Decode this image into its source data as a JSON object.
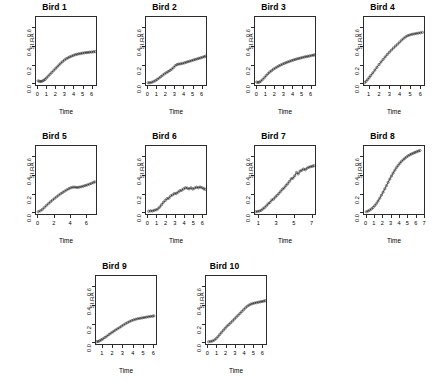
{
  "figure": {
    "layout": "4x4x2 grid of small-multiple panels",
    "background_color": "#ffffff",
    "axis_color": "#2b2b2b",
    "point_color": "#333333",
    "line_color": "#222222"
  },
  "chart_data": [
    {
      "type": "scatter",
      "title": "Bird 1",
      "xlabel": "Time",
      "ylabel": "SI.RA",
      "xlim": [
        -0.25,
        6.6
      ],
      "ylim": [
        -0.03,
        0.72
      ],
      "xticks": [
        0,
        1,
        2,
        3,
        4,
        5,
        6
      ],
      "yticks": [
        0.0,
        0.2,
        0.4,
        0.6
      ],
      "ytick_labels": [
        "0.0",
        "0.2",
        "0.4",
        "0.6"
      ],
      "grid": false,
      "legend": "none",
      "marker": "open-circle",
      "has_fit_line": true,
      "x": [
        0.1,
        0.25,
        0.4,
        0.55,
        0.7,
        0.85,
        1.0,
        1.2,
        1.4,
        1.6,
        1.8,
        2.0,
        2.2,
        2.4,
        2.6,
        2.8,
        3.0,
        3.2,
        3.4,
        3.6,
        3.8,
        4.0,
        4.2,
        4.4,
        4.6,
        4.8,
        5.0,
        5.2,
        5.4,
        5.6,
        5.8,
        6.0,
        6.2,
        6.4
      ],
      "y": [
        0.025,
        0.02,
        0.018,
        0.022,
        0.03,
        0.04,
        0.055,
        0.075,
        0.095,
        0.115,
        0.135,
        0.155,
        0.175,
        0.195,
        0.215,
        0.232,
        0.248,
        0.262,
        0.272,
        0.282,
        0.29,
        0.298,
        0.305,
        0.31,
        0.315,
        0.318,
        0.322,
        0.325,
        0.328,
        0.33,
        0.332,
        0.334,
        0.336,
        0.338
      ]
    },
    {
      "type": "scatter",
      "title": "Bird 2",
      "xlabel": "Time",
      "ylabel": "SI.RA",
      "xlim": [
        -0.25,
        6.6
      ],
      "ylim": [
        -0.03,
        0.72
      ],
      "xticks": [
        0,
        1,
        2,
        3,
        4,
        5,
        6
      ],
      "yticks": [
        0.0,
        0.2,
        0.4,
        0.6
      ],
      "ytick_labels": [
        "0.0",
        "0.2",
        "0.4",
        "0.6"
      ],
      "grid": false,
      "legend": "none",
      "marker": "open-circle",
      "has_fit_line": true,
      "x": [
        0.1,
        0.3,
        0.5,
        0.7,
        0.9,
        1.1,
        1.3,
        1.5,
        1.7,
        1.9,
        2.1,
        2.3,
        2.5,
        2.7,
        2.9,
        3.1,
        3.3,
        3.5,
        3.7,
        3.9,
        4.1,
        4.3,
        4.5,
        4.7,
        4.9,
        5.1,
        5.3,
        5.5,
        5.7,
        5.9,
        6.1,
        6.3,
        6.45
      ],
      "y": [
        0.005,
        0.005,
        0.01,
        0.018,
        0.028,
        0.04,
        0.055,
        0.07,
        0.085,
        0.1,
        0.112,
        0.124,
        0.136,
        0.15,
        0.168,
        0.188,
        0.2,
        0.205,
        0.208,
        0.212,
        0.218,
        0.224,
        0.23,
        0.236,
        0.242,
        0.248,
        0.254,
        0.26,
        0.266,
        0.272,
        0.278,
        0.284,
        0.29
      ]
    },
    {
      "type": "scatter",
      "title": "Bird 3",
      "xlabel": "Time",
      "ylabel": "SI.RA",
      "xlim": [
        -0.25,
        6.6
      ],
      "ylim": [
        -0.03,
        0.72
      ],
      "xticks": [
        0,
        1,
        2,
        3,
        4,
        5,
        6
      ],
      "yticks": [
        0.0,
        0.2,
        0.4,
        0.6
      ],
      "ytick_labels": [
        "0.0",
        "0.2",
        "0.4",
        "0.6"
      ],
      "grid": false,
      "legend": "none",
      "marker": "open-circle",
      "has_fit_line": true,
      "x": [
        0.05,
        0.2,
        0.35,
        0.5,
        0.7,
        0.9,
        1.1,
        1.3,
        1.5,
        1.7,
        1.9,
        2.1,
        2.3,
        2.5,
        2.7,
        2.9,
        3.1,
        3.3,
        3.5,
        3.7,
        3.9,
        4.1,
        4.3,
        4.5,
        4.7,
        4.9,
        5.1,
        5.3,
        5.5,
        5.7,
        5.9,
        6.1,
        6.3,
        6.45
      ],
      "y": [
        0.012,
        0.008,
        0.012,
        0.022,
        0.04,
        0.06,
        0.082,
        0.102,
        0.12,
        0.135,
        0.15,
        0.162,
        0.174,
        0.185,
        0.195,
        0.204,
        0.212,
        0.22,
        0.228,
        0.235,
        0.242,
        0.248,
        0.254,
        0.26,
        0.265,
        0.27,
        0.275,
        0.28,
        0.284,
        0.288,
        0.292,
        0.296,
        0.3,
        0.304
      ]
    },
    {
      "type": "scatter",
      "title": "Bird 4",
      "xlabel": "Time",
      "ylabel": "SI.RA",
      "xlim": [
        0.45,
        6.45
      ],
      "ylim": [
        -0.03,
        0.72
      ],
      "xticks": [
        1,
        2,
        3,
        4,
        5,
        6
      ],
      "yticks": [
        0.0,
        0.2,
        0.4,
        0.6
      ],
      "ytick_labels": [
        "0.0",
        "0.2",
        "0.4",
        "0.6"
      ],
      "grid": false,
      "legend": "none",
      "marker": "open-circle",
      "has_fit_line": true,
      "x": [
        0.6,
        0.75,
        0.9,
        1.05,
        1.2,
        1.4,
        1.6,
        1.8,
        2.0,
        2.2,
        2.4,
        2.6,
        2.8,
        3.0,
        3.2,
        3.4,
        3.6,
        3.8,
        4.0,
        4.2,
        4.4,
        4.6,
        4.8,
        5.0,
        5.2,
        5.4,
        5.6,
        5.8,
        6.0,
        6.2
      ],
      "y": [
        0.005,
        0.02,
        0.04,
        0.06,
        0.082,
        0.11,
        0.14,
        0.17,
        0.2,
        0.228,
        0.255,
        0.282,
        0.308,
        0.332,
        0.355,
        0.378,
        0.398,
        0.418,
        0.44,
        0.462,
        0.482,
        0.498,
        0.51,
        0.518,
        0.524,
        0.528,
        0.532,
        0.536,
        0.54,
        0.545
      ]
    },
    {
      "type": "scatter",
      "title": "Bird 5",
      "xlabel": "Time",
      "ylabel": "SI.RA",
      "xlim": [
        -0.3,
        7.3
      ],
      "ylim": [
        -0.03,
        0.72
      ],
      "xticks": [
        0,
        2,
        4,
        6
      ],
      "yticks": [
        0.0,
        0.2,
        0.4,
        0.6
      ],
      "ytick_labels": [
        "0.0",
        "0.2",
        "0.4",
        "0.6"
      ],
      "grid": false,
      "legend": "none",
      "marker": "open-circle",
      "has_fit_line": true,
      "x": [
        0.1,
        0.35,
        0.6,
        0.85,
        1.1,
        1.35,
        1.6,
        1.85,
        2.1,
        2.35,
        2.6,
        2.85,
        3.1,
        3.35,
        3.6,
        3.85,
        4.1,
        4.35,
        4.6,
        4.85,
        5.1,
        5.35,
        5.6,
        5.85,
        6.1,
        6.35,
        6.6,
        6.85,
        7.05
      ],
      "y": [
        0.005,
        0.015,
        0.03,
        0.05,
        0.072,
        0.092,
        0.112,
        0.13,
        0.148,
        0.165,
        0.182,
        0.198,
        0.212,
        0.226,
        0.24,
        0.252,
        0.262,
        0.268,
        0.268,
        0.265,
        0.268,
        0.272,
        0.278,
        0.285,
        0.292,
        0.3,
        0.308,
        0.318,
        0.325
      ]
    },
    {
      "type": "scatter",
      "title": "Bird 6",
      "xlabel": "Time",
      "ylabel": "SI.RA",
      "xlim": [
        -0.25,
        6.5
      ],
      "ylim": [
        -0.03,
        0.72
      ],
      "xticks": [
        0,
        1,
        2,
        3,
        4,
        5,
        6
      ],
      "yticks": [
        0.0,
        0.2,
        0.4,
        0.6
      ],
      "ytick_labels": [
        "0.0",
        "0.2",
        "0.4",
        "0.6"
      ],
      "grid": false,
      "legend": "none",
      "marker": "open-circle",
      "has_fit_line": true,
      "x": [
        0.15,
        0.35,
        0.55,
        0.75,
        0.95,
        1.15,
        1.35,
        1.55,
        1.75,
        1.95,
        2.15,
        2.35,
        2.55,
        2.75,
        2.95,
        3.15,
        3.35,
        3.55,
        3.75,
        3.95,
        4.15,
        4.35,
        4.55,
        4.75,
        4.95,
        5.15,
        5.35,
        5.55,
        5.75,
        5.95,
        6.15,
        6.3
      ],
      "y": [
        0.01,
        0.015,
        0.012,
        0.02,
        0.025,
        0.035,
        0.055,
        0.08,
        0.105,
        0.125,
        0.145,
        0.15,
        0.175,
        0.185,
        0.2,
        0.2,
        0.215,
        0.23,
        0.235,
        0.25,
        0.262,
        0.258,
        0.25,
        0.262,
        0.248,
        0.258,
        0.268,
        0.262,
        0.27,
        0.262,
        0.252,
        0.245
      ]
    },
    {
      "type": "scatter",
      "title": "Bird 7",
      "xlabel": "Time",
      "ylabel": "SI.RA",
      "xlim": [
        0.5,
        7.5
      ],
      "ylim": [
        -0.03,
        0.72
      ],
      "xticks": [
        1,
        3,
        5,
        7
      ],
      "yticks": [
        0.0,
        0.2,
        0.4,
        0.6
      ],
      "ytick_labels": [
        "0.0",
        "0.2",
        "0.4",
        "0.6"
      ],
      "grid": false,
      "legend": "none",
      "marker": "open-circle",
      "has_fit_line": true,
      "x": [
        0.7,
        0.9,
        1.1,
        1.3,
        1.5,
        1.7,
        1.9,
        2.1,
        2.3,
        2.5,
        2.7,
        2.9,
        3.1,
        3.3,
        3.5,
        3.7,
        3.9,
        4.1,
        4.3,
        4.5,
        4.7,
        4.9,
        5.1,
        5.3,
        5.5,
        5.7,
        5.9,
        6.1,
        6.3,
        6.5,
        6.7,
        6.9,
        7.1,
        7.25
      ],
      "y": [
        0.005,
        0.008,
        0.012,
        0.02,
        0.035,
        0.05,
        0.068,
        0.09,
        0.105,
        0.13,
        0.14,
        0.162,
        0.18,
        0.2,
        0.222,
        0.245,
        0.26,
        0.285,
        0.305,
        0.33,
        0.358,
        0.365,
        0.39,
        0.425,
        0.41,
        0.44,
        0.45,
        0.462,
        0.455,
        0.472,
        0.482,
        0.488,
        0.492,
        0.498
      ]
    },
    {
      "type": "scatter",
      "title": "Bird 8",
      "xlabel": "Time",
      "ylabel": "SI.RA",
      "xlim": [
        -0.3,
        7.1
      ],
      "ylim": [
        -0.03,
        0.72
      ],
      "xticks": [
        0,
        1,
        2,
        3,
        4,
        5,
        6,
        7
      ],
      "yticks": [
        0.0,
        0.2,
        0.4,
        0.6
      ],
      "ytick_labels": [
        "0.0",
        "0.2",
        "0.4",
        "0.6"
      ],
      "grid": false,
      "legend": "none",
      "marker": "open-circle",
      "has_fit_line": true,
      "x": [
        0.1,
        0.3,
        0.5,
        0.7,
        0.9,
        1.1,
        1.3,
        1.5,
        1.7,
        1.9,
        2.1,
        2.3,
        2.5,
        2.7,
        2.9,
        3.1,
        3.3,
        3.5,
        3.7,
        3.9,
        4.1,
        4.3,
        4.5,
        4.7,
        4.9,
        5.1,
        5.3,
        5.5,
        5.7,
        5.9,
        6.1,
        6.3,
        6.5
      ],
      "y": [
        0.005,
        0.012,
        0.022,
        0.035,
        0.05,
        0.07,
        0.092,
        0.12,
        0.15,
        0.182,
        0.215,
        0.25,
        0.285,
        0.32,
        0.355,
        0.388,
        0.42,
        0.45,
        0.478,
        0.502,
        0.525,
        0.545,
        0.562,
        0.578,
        0.592,
        0.605,
        0.615,
        0.625,
        0.632,
        0.64,
        0.648,
        0.655,
        0.66
      ]
    },
    {
      "type": "scatter",
      "title": "Bird 9",
      "xlabel": "Time",
      "ylabel": "SI.RA",
      "xlim": [
        0.35,
        6.35
      ],
      "ylim": [
        -0.03,
        0.72
      ],
      "xticks": [
        1,
        2,
        3,
        4,
        5,
        6
      ],
      "yticks": [
        0.0,
        0.2,
        0.4,
        0.6
      ],
      "ytick_labels": [
        "0.0",
        "0.2",
        "0.4",
        "0.6"
      ],
      "grid": false,
      "legend": "none",
      "marker": "open-circle",
      "has_fit_line": true,
      "x": [
        0.5,
        0.65,
        0.8,
        0.95,
        1.1,
        1.3,
        1.5,
        1.7,
        1.9,
        2.1,
        2.3,
        2.5,
        2.7,
        2.9,
        3.1,
        3.3,
        3.5,
        3.7,
        3.9,
        4.1,
        4.3,
        4.5,
        4.7,
        4.9,
        5.1,
        5.3,
        5.5,
        5.7,
        5.9,
        6.05
      ],
      "y": [
        0.005,
        0.008,
        0.015,
        0.025,
        0.035,
        0.05,
        0.065,
        0.082,
        0.098,
        0.112,
        0.128,
        0.142,
        0.155,
        0.17,
        0.185,
        0.198,
        0.21,
        0.222,
        0.232,
        0.24,
        0.246,
        0.252,
        0.256,
        0.26,
        0.264,
        0.268,
        0.272,
        0.276,
        0.278,
        0.282
      ]
    },
    {
      "type": "scatter",
      "title": "Bird 10",
      "xlabel": "Time",
      "ylabel": "SI.RA",
      "xlim": [
        -0.25,
        6.5
      ],
      "ylim": [
        -0.03,
        0.72
      ],
      "xticks": [
        0,
        1,
        2,
        3,
        4,
        5,
        6
      ],
      "yticks": [
        0.0,
        0.2,
        0.4,
        0.6
      ],
      "ytick_labels": [
        "0.0",
        "0.2",
        "0.4",
        "0.6"
      ],
      "grid": false,
      "legend": "none",
      "marker": "open-circle",
      "has_fit_line": true,
      "x": [
        0.15,
        0.35,
        0.55,
        0.75,
        0.95,
        1.15,
        1.35,
        1.55,
        1.75,
        1.95,
        2.15,
        2.35,
        2.55,
        2.75,
        2.95,
        3.15,
        3.35,
        3.55,
        3.75,
        3.95,
        4.15,
        4.35,
        4.55,
        4.75,
        4.95,
        5.15,
        5.35,
        5.55,
        5.75,
        5.95,
        6.15,
        6.3
      ],
      "y": [
        0.005,
        0.008,
        0.012,
        0.022,
        0.038,
        0.058,
        0.082,
        0.105,
        0.128,
        0.15,
        0.172,
        0.19,
        0.208,
        0.228,
        0.248,
        0.268,
        0.288,
        0.308,
        0.328,
        0.348,
        0.368,
        0.385,
        0.398,
        0.408,
        0.415,
        0.42,
        0.424,
        0.428,
        0.432,
        0.436,
        0.44,
        0.445
      ]
    }
  ]
}
